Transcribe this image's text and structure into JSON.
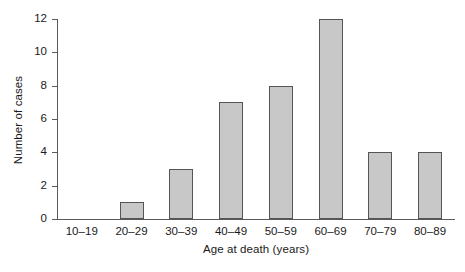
{
  "chart_data": {
    "type": "bar",
    "title": "",
    "xlabel": "Age at death (years)",
    "ylabel": "Number of cases",
    "categories": [
      "10–19",
      "20–29",
      "30–39",
      "40–49",
      "50–59",
      "60–69",
      "70–79",
      "80–89"
    ],
    "values": [
      0,
      1,
      3,
      7,
      8,
      12,
      4,
      4
    ],
    "ylim": [
      0,
      12
    ],
    "yticks": [
      0,
      2,
      4,
      6,
      8,
      10,
      12
    ],
    "yticklabels": [
      "0",
      "2",
      "4",
      "6",
      "8",
      "10",
      "12"
    ],
    "grid": false,
    "legend": false,
    "bar_color": "#c8c8c8",
    "bar_edge_color": "#555555",
    "axis_color": "#5a5a5a",
    "background": "#ffffff"
  }
}
